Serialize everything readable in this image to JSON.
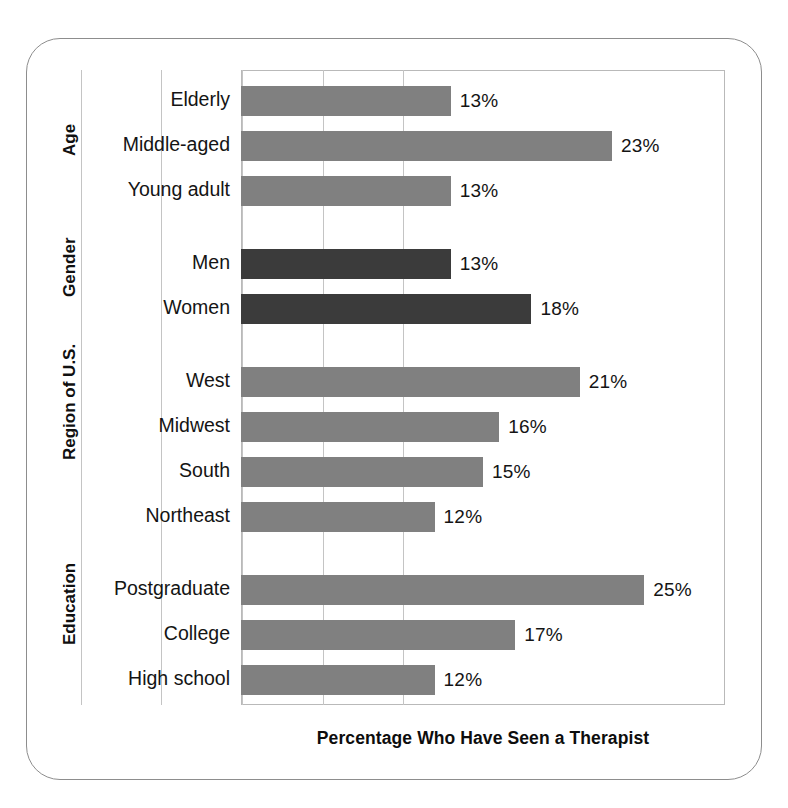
{
  "chart_data": {
    "type": "bar",
    "orientation": "horizontal",
    "title": "",
    "xlabel": "Percentage Who Have Seen a Therapist",
    "ylabel": "",
    "xlim": [
      0,
      30
    ],
    "xticks": [
      0,
      5,
      10,
      15,
      20,
      25,
      30
    ],
    "grid": true,
    "legend": "none",
    "value_suffix": "%",
    "colors": {
      "bar_gray": "#808080",
      "bar_dark": "#3b3b3b",
      "gridline": "#c4c4c4",
      "plot_border": "#b9b9b9",
      "frame_border": "#8d8d8d",
      "text": "#141414",
      "background": "#ffffff"
    },
    "groups": [
      {
        "name": "Age",
        "categories": [
          "Elderly",
          "Middle-aged",
          "Young adult"
        ],
        "values": [
          13,
          23,
          13
        ],
        "labels": [
          "13%",
          "23%",
          "13%"
        ],
        "color": "#808080"
      },
      {
        "name": "Gender",
        "categories": [
          "Men",
          "Women"
        ],
        "values": [
          13,
          18
        ],
        "labels": [
          "13%",
          "18%"
        ],
        "color": "#3b3b3b"
      },
      {
        "name": "Region of U.S.",
        "categories": [
          "West",
          "Midwest",
          "South",
          "Northeast"
        ],
        "values": [
          21,
          16,
          15,
          12
        ],
        "labels": [
          "21%",
          "16%",
          "15%",
          "12%"
        ],
        "color": "#808080"
      },
      {
        "name": "Education",
        "categories": [
          "Postgraduate",
          "College",
          "High school"
        ],
        "values": [
          25,
          17,
          12
        ],
        "labels": [
          "25%",
          "17%",
          "12%"
        ],
        "color": "#808080"
      }
    ],
    "categories": [
      "Elderly",
      "Middle-aged",
      "Young adult",
      "Men",
      "Women",
      "West",
      "Midwest",
      "South",
      "Northeast",
      "Postgraduate",
      "College",
      "High school"
    ],
    "values": [
      13,
      23,
      13,
      13,
      18,
      21,
      16,
      15,
      12,
      25,
      17,
      12
    ]
  }
}
